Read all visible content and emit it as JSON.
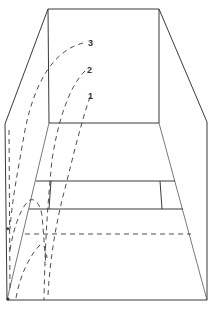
{
  "diagram": {
    "type": "perspective room with trajectory curves",
    "trajectory_labels": [
      "1",
      "2",
      "3"
    ],
    "colors": {
      "line": "#3a3a3a",
      "background": "#ffffff"
    },
    "labels": {
      "curve_1": "1",
      "curve_2": "2",
      "curve_3": "3"
    },
    "marker": "*"
  }
}
